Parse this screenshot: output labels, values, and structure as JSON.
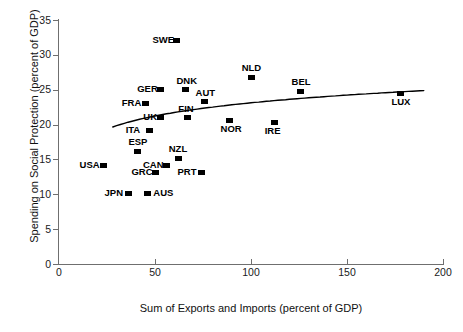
{
  "chart_data": {
    "type": "scatter",
    "title": "",
    "xlabel": "Sum of Exports and Imports (percent of GDP)",
    "ylabel": "Spending on Social Protection (percent of GDP)",
    "xlim": [
      0,
      200
    ],
    "ylim": [
      0,
      35
    ],
    "xticks": [
      0,
      50,
      100,
      150,
      200
    ],
    "xtick_labels": [
      "0",
      "50",
      "100",
      "150",
      "200"
    ],
    "yticks": [
      0,
      5,
      10,
      15,
      20,
      25,
      30,
      35
    ],
    "ytick_labels": [
      "0",
      "5",
      "10",
      "15",
      "20",
      "25",
      "30",
      "35"
    ],
    "grid": false,
    "legend": "none",
    "marker_color": "#000000",
    "axis_color": "#6f6f6f",
    "trendline": {
      "present": true,
      "color": "#000000",
      "description": "upward-sloping concave logarithmic fit"
    },
    "points": [
      {
        "label": "SWE",
        "x": 61,
        "y": 32.0,
        "label_pos": "left"
      },
      {
        "label": "GER",
        "x": 53,
        "y": 25.0,
        "label_pos": "left"
      },
      {
        "label": "DNK",
        "x": 66,
        "y": 25.0,
        "label_pos": "above"
      },
      {
        "label": "AUT",
        "x": 76,
        "y": 23.3,
        "label_pos": "above"
      },
      {
        "label": "NLD",
        "x": 100,
        "y": 26.8,
        "label_pos": "above"
      },
      {
        "label": "BEL",
        "x": 126,
        "y": 24.8,
        "label_pos": "above"
      },
      {
        "label": "LUX",
        "x": 178,
        "y": 24.5,
        "label_pos": "below"
      },
      {
        "label": "FRA",
        "x": 45,
        "y": 23.0,
        "label_pos": "left"
      },
      {
        "label": "UK",
        "x": 53,
        "y": 21.0,
        "label_pos": "left"
      },
      {
        "label": "FIN",
        "x": 67,
        "y": 21.0,
        "label_pos": "above"
      },
      {
        "label": "ITA",
        "x": 47,
        "y": 19.1,
        "label_pos": "left"
      },
      {
        "label": "NOR",
        "x": 89,
        "y": 20.6,
        "label_pos": "below"
      },
      {
        "label": "IRE",
        "x": 112,
        "y": 20.3,
        "label_pos": "below"
      },
      {
        "label": "ESP",
        "x": 41,
        "y": 16.2,
        "label_pos": "above"
      },
      {
        "label": "NZL",
        "x": 62,
        "y": 15.2,
        "label_pos": "above"
      },
      {
        "label": "USA",
        "x": 23,
        "y": 14.2,
        "label_pos": "left"
      },
      {
        "label": "CAN",
        "x": 56,
        "y": 14.2,
        "label_pos": "left"
      },
      {
        "label": "GRC",
        "x": 50,
        "y": 13.1,
        "label_pos": "left"
      },
      {
        "label": "PRT",
        "x": 74,
        "y": 13.1,
        "label_pos": "left"
      },
      {
        "label": "JPN",
        "x": 36,
        "y": 10.1,
        "label_pos": "left"
      },
      {
        "label": "AUS",
        "x": 46,
        "y": 10.1,
        "label_pos": "right"
      }
    ]
  }
}
